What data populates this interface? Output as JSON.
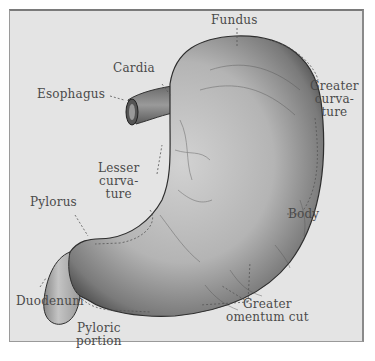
{
  "diagram": {
    "labels": {
      "fundus": "Fundus",
      "cardia": "Cardia",
      "esophagus": "Esophagus",
      "greater_curvature_1": "Greater",
      "greater_curvature_2": "curva-",
      "greater_curvature_3": "ture",
      "lesser_curvature_1": "Lesser",
      "lesser_curvature_2": "curva-",
      "lesser_curvature_3": "ture",
      "pylorus": "Pylorus",
      "body": "Body",
      "duodenum": "Duodenum",
      "greater_omentum_1": "Greater",
      "greater_omentum_2": "omentum cut",
      "pyloric_portion_1": "Pyloric",
      "pyloric_portion_2": "portion"
    },
    "colors": {
      "background": "#e4e4e4",
      "label_text": "#4a4a4a",
      "organ_dark": "#3a3a3a",
      "organ_light": "#c8c8c8"
    }
  }
}
